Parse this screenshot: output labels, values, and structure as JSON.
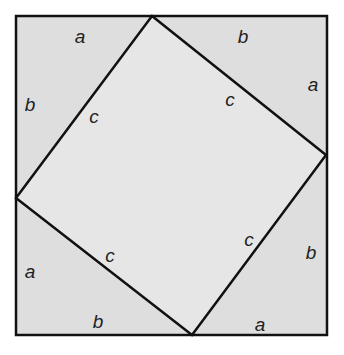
{
  "diagram": {
    "title": "",
    "colors": {
      "background": "#ffffff",
      "fill": "#dedede",
      "inner_fill": "#e6e6e6",
      "stroke": "#111111"
    },
    "outer_square": {
      "x1": 16,
      "y1": 16,
      "x2": 327,
      "y2": 335
    },
    "inner_square": {
      "points": [
        [
          152,
          16
        ],
        [
          326,
          155
        ],
        [
          192,
          335
        ],
        [
          16,
          198
        ]
      ]
    },
    "labels": [
      {
        "id": "top-a",
        "text": "a",
        "x": 80,
        "y": 36
      },
      {
        "id": "top-b",
        "text": "b",
        "x": 243,
        "y": 36
      },
      {
        "id": "left-b",
        "text": "b",
        "x": 30,
        "y": 104
      },
      {
        "id": "right-a",
        "text": "a",
        "x": 313,
        "y": 84
      },
      {
        "id": "c-top-left",
        "text": "c",
        "x": 94,
        "y": 116
      },
      {
        "id": "c-top-right",
        "text": "c",
        "x": 230,
        "y": 99
      },
      {
        "id": "c-bottom-left",
        "text": "c",
        "x": 110,
        "y": 255
      },
      {
        "id": "c-bottom-right",
        "text": "c",
        "x": 249,
        "y": 239
      },
      {
        "id": "left-a",
        "text": "a",
        "x": 30,
        "y": 271
      },
      {
        "id": "right-b",
        "text": "b",
        "x": 311,
        "y": 252
      },
      {
        "id": "bottom-b",
        "text": "b",
        "x": 98,
        "y": 321
      },
      {
        "id": "bottom-a",
        "text": "a",
        "x": 260,
        "y": 324
      }
    ]
  }
}
